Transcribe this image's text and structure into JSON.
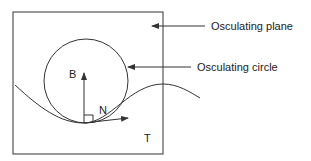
{
  "diagram": {
    "labels": {
      "binormal": "B",
      "normal": "N",
      "tangent": "T",
      "osculating_plane": "Osculating plane",
      "osculating_circle": "Osculating circle"
    },
    "colors": {
      "stroke": "#333333",
      "text": "#222222",
      "background": "#ffffff"
    }
  }
}
